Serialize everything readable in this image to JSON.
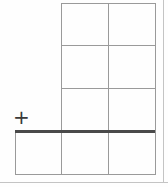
{
  "worksheet": {
    "type": "column-addition-grid",
    "operator": "+",
    "columns": 2,
    "addend_rows": 3,
    "answer_row_columns": 3,
    "cells": {
      "addends": [
        [
          "",
          ""
        ],
        [
          "",
          ""
        ],
        [
          "",
          ""
        ]
      ],
      "answer": [
        "",
        "",
        ""
      ]
    }
  },
  "colors": {
    "grid_line": "#9a9a9a",
    "sum_line": "#4a4a4a",
    "operator": "#3a3a3a",
    "background": "#ffffff"
  }
}
